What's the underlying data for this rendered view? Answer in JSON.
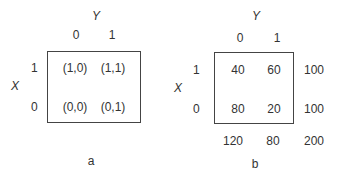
{
  "diagrams": [
    {
      "caption": "a",
      "row_variable": "X",
      "col_variable": "Y",
      "col_labels": [
        "0",
        "1"
      ],
      "row_labels": [
        "1",
        "0"
      ],
      "cells": [
        [
          "(1,0)",
          "(1,1)"
        ],
        [
          "(0,0)",
          "(0,1)"
        ]
      ]
    },
    {
      "caption": "b",
      "row_variable": "X",
      "col_variable": "Y",
      "col_labels": [
        "0",
        "1"
      ],
      "row_labels": [
        "1",
        "0"
      ],
      "cells": [
        [
          "40",
          "60"
        ],
        [
          "80",
          "20"
        ]
      ],
      "row_totals": [
        "100",
        "100"
      ],
      "col_totals": [
        "120",
        "80"
      ],
      "grand_total": "200"
    }
  ]
}
